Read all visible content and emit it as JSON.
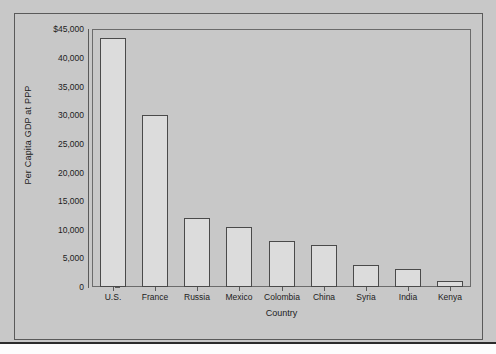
{
  "chart_data": {
    "type": "bar",
    "title": "",
    "xlabel": "Country",
    "ylabel": "Per Capita GDP at PPP",
    "categories": [
      "U.S.",
      "France",
      "Russia",
      "Mexico",
      "Colombia",
      "China",
      "Syria",
      "India",
      "Kenya"
    ],
    "values": [
      43500,
      30000,
      12000,
      10400,
      8000,
      7300,
      3800,
      3100,
      1100
    ],
    "ylim": [
      0,
      45000
    ],
    "yticks": [
      0,
      5000,
      10000,
      15000,
      20000,
      25000,
      30000,
      35000,
      40000,
      45000
    ],
    "ytick_labels": [
      "0",
      "5,000",
      "10,000",
      "15,000",
      "20,000",
      "25,000",
      "30,000",
      "35,000",
      "40,000",
      "$45,000"
    ],
    "grid": false,
    "legend": false,
    "bar_fill": "#dcdcdc",
    "bar_edge": "#4a4a4a",
    "background": "#c8c8c8"
  },
  "axes": {
    "y_title": "Per Capita GDP at PPP",
    "x_title": "Country",
    "y_labels": {
      "t45000": "$45,000",
      "t40000": "40,000",
      "t35000": "35,000",
      "t30000": "30,000",
      "t25000": "25,000",
      "t20000": "20,000",
      "t15000": "15,000",
      "t10000": "10,000",
      "t5000": "5,000",
      "t0": "0"
    },
    "x_labels": {
      "c0": "U.S.",
      "c1": "France",
      "c2": "Russia",
      "c3": "Mexico",
      "c4": "Colombia",
      "c5": "China",
      "c6": "Syria",
      "c7": "India",
      "c8": "Kenya"
    }
  }
}
